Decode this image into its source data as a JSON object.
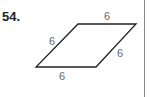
{
  "problem": {
    "number": "54.",
    "shape": "parallelogram (rhombus)",
    "labels": {
      "top": "6",
      "left": "6",
      "right": "6",
      "bottom": "6"
    }
  }
}
